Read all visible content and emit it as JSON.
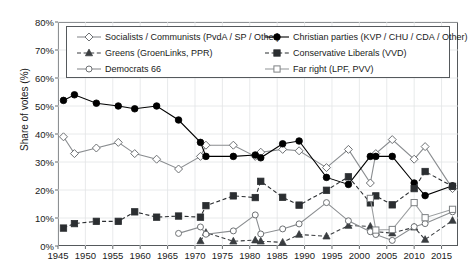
{
  "chart_data": {
    "type": "line",
    "title": "",
    "xlabel": "",
    "ylabel": "Share of votes (%)",
    "xlim": [
      1945,
      2018
    ],
    "ylim": [
      0,
      80
    ],
    "ytick_labels": [
      "0%",
      "10%",
      "20%",
      "30%",
      "40%",
      "50%",
      "60%",
      "70%",
      "80%"
    ],
    "ytick_values": [
      0,
      10,
      20,
      30,
      40,
      50,
      60,
      70,
      80
    ],
    "xtick_labels": [
      "1945",
      "1950",
      "1955",
      "1960",
      "1965",
      "1970",
      "1975",
      "1980",
      "1985",
      "1990",
      "1995",
      "2000",
      "2005",
      "2010",
      "2015"
    ],
    "xtick_values": [
      1945,
      1950,
      1955,
      1960,
      1965,
      1970,
      1975,
      1980,
      1985,
      1990,
      1995,
      2000,
      2005,
      2010,
      2015
    ],
    "grid": true,
    "legend_position": "top-inside",
    "series": [
      {
        "name": "Socialists / Communists (PvdA / SP / Other)",
        "marker": "diamond-open",
        "dash": false,
        "color": "#8a8d90",
        "points": [
          {
            "x": 1946,
            "y": 39.0
          },
          {
            "x": 1948,
            "y": 33.0
          },
          {
            "x": 1952,
            "y": 35.0
          },
          {
            "x": 1956,
            "y": 37.0
          },
          {
            "x": 1959,
            "y": 33.0
          },
          {
            "x": 1963,
            "y": 31.0
          },
          {
            "x": 1967,
            "y": 27.5
          },
          {
            "x": 1971,
            "y": 32.0
          },
          {
            "x": 1972,
            "y": 36.0
          },
          {
            "x": 1977,
            "y": 36.0
          },
          {
            "x": 1981,
            "y": 32.0
          },
          {
            "x": 1982,
            "y": 33.5
          },
          {
            "x": 1986,
            "y": 34.5
          },
          {
            "x": 1989,
            "y": 34.0
          },
          {
            "x": 1994,
            "y": 28.0
          },
          {
            "x": 1998,
            "y": 34.5
          },
          {
            "x": 2002,
            "y": 22.5
          },
          {
            "x": 2003,
            "y": 33.0
          },
          {
            "x": 2006,
            "y": 38.0
          },
          {
            "x": 2010,
            "y": 31.0
          },
          {
            "x": 2012,
            "y": 35.5
          },
          {
            "x": 2017,
            "y": 20.5
          }
        ]
      },
      {
        "name": "Christian parties (KVP / CHU / CDA / Other)",
        "marker": "circle-filled",
        "dash": false,
        "color": "#000000",
        "points": [
          {
            "x": 1946,
            "y": 52.0
          },
          {
            "x": 1948,
            "y": 54.0
          },
          {
            "x": 1952,
            "y": 51.0
          },
          {
            "x": 1956,
            "y": 50.0
          },
          {
            "x": 1959,
            "y": 49.0
          },
          {
            "x": 1963,
            "y": 50.0
          },
          {
            "x": 1967,
            "y": 45.0
          },
          {
            "x": 1971,
            "y": 37.0
          },
          {
            "x": 1972,
            "y": 32.0
          },
          {
            "x": 1977,
            "y": 32.0
          },
          {
            "x": 1981,
            "y": 32.5
          },
          {
            "x": 1982,
            "y": 31.5
          },
          {
            "x": 1986,
            "y": 36.5
          },
          {
            "x": 1989,
            "y": 37.5
          },
          {
            "x": 1994,
            "y": 24.5
          },
          {
            "x": 1998,
            "y": 22.0
          },
          {
            "x": 2002,
            "y": 32.0
          },
          {
            "x": 2003,
            "y": 32.0
          },
          {
            "x": 2006,
            "y": 32.0
          },
          {
            "x": 2010,
            "y": 22.5
          },
          {
            "x": 2012,
            "y": 18.0
          },
          {
            "x": 2017,
            "y": 21.5
          }
        ]
      },
      {
        "name": "Greens (GroenLinks, PPR)",
        "marker": "triangle-filled",
        "dash": true,
        "color": "#3a3d40",
        "points": [
          {
            "x": 1971,
            "y": 1.8
          },
          {
            "x": 1972,
            "y": 4.8
          },
          {
            "x": 1977,
            "y": 1.7
          },
          {
            "x": 1981,
            "y": 2.1
          },
          {
            "x": 1982,
            "y": 1.7
          },
          {
            "x": 1986,
            "y": 1.3
          },
          {
            "x": 1989,
            "y": 4.1
          },
          {
            "x": 1994,
            "y": 3.5
          },
          {
            "x": 1998,
            "y": 7.3
          },
          {
            "x": 2002,
            "y": 7.0
          },
          {
            "x": 2003,
            "y": 5.1
          },
          {
            "x": 2006,
            "y": 4.6
          },
          {
            "x": 2010,
            "y": 6.7
          },
          {
            "x": 2012,
            "y": 2.3
          },
          {
            "x": 2017,
            "y": 9.1
          }
        ]
      },
      {
        "name": "Conservative Liberals (VVD)",
        "marker": "square-filled",
        "dash": true,
        "color": "#2b2e31",
        "points": [
          {
            "x": 1946,
            "y": 6.4
          },
          {
            "x": 1948,
            "y": 8.0
          },
          {
            "x": 1952,
            "y": 8.8
          },
          {
            "x": 1956,
            "y": 8.8
          },
          {
            "x": 1959,
            "y": 12.2
          },
          {
            "x": 1963,
            "y": 10.3
          },
          {
            "x": 1967,
            "y": 10.7
          },
          {
            "x": 1971,
            "y": 10.3
          },
          {
            "x": 1972,
            "y": 14.4
          },
          {
            "x": 1977,
            "y": 17.9
          },
          {
            "x": 1981,
            "y": 17.3
          },
          {
            "x": 1982,
            "y": 23.1
          },
          {
            "x": 1986,
            "y": 17.4
          },
          {
            "x": 1989,
            "y": 14.6
          },
          {
            "x": 1994,
            "y": 19.9
          },
          {
            "x": 1998,
            "y": 24.7
          },
          {
            "x": 2002,
            "y": 15.4
          },
          {
            "x": 2003,
            "y": 17.9
          },
          {
            "x": 2006,
            "y": 14.7
          },
          {
            "x": 2010,
            "y": 20.5
          },
          {
            "x": 2012,
            "y": 26.6
          },
          {
            "x": 2017,
            "y": 21.3
          }
        ]
      },
      {
        "name": "Democrats 66",
        "marker": "circle-open",
        "dash": false,
        "color": "#8a8d90",
        "points": [
          {
            "x": 1967,
            "y": 4.5
          },
          {
            "x": 1971,
            "y": 6.8
          },
          {
            "x": 1972,
            "y": 4.2
          },
          {
            "x": 1977,
            "y": 5.4
          },
          {
            "x": 1981,
            "y": 11.1
          },
          {
            "x": 1982,
            "y": 4.3
          },
          {
            "x": 1986,
            "y": 6.1
          },
          {
            "x": 1989,
            "y": 7.9
          },
          {
            "x": 1994,
            "y": 15.5
          },
          {
            "x": 1998,
            "y": 9.0
          },
          {
            "x": 2002,
            "y": 5.1
          },
          {
            "x": 2003,
            "y": 4.1
          },
          {
            "x": 2006,
            "y": 2.0
          },
          {
            "x": 2010,
            "y": 6.9
          },
          {
            "x": 2012,
            "y": 8.0
          },
          {
            "x": 2017,
            "y": 12.2
          }
        ]
      },
      {
        "name": "Far right (LPF, PVV)",
        "marker": "square-open",
        "dash": false,
        "color": "#9a9d9f",
        "points": [
          {
            "x": 2002,
            "y": 17.0
          },
          {
            "x": 2003,
            "y": 5.7
          },
          {
            "x": 2006,
            "y": 5.9
          },
          {
            "x": 2010,
            "y": 15.5
          },
          {
            "x": 2012,
            "y": 10.1
          },
          {
            "x": 2017,
            "y": 13.1
          }
        ]
      }
    ]
  }
}
